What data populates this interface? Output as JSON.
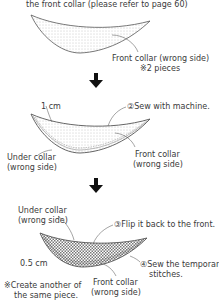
{
  "step1": {
    "caption": "the front collar (please refer to page 60)",
    "label_line1": "Front collar (wrong side)",
    "label_line2": "※2 pieces"
  },
  "step2": {
    "seam_allowance": "1 cm",
    "instruction": "②Sew with machine.",
    "under_collar_line1": "Under collar",
    "under_collar_line2": "(wrong side)",
    "front_collar_line1": "Front collar",
    "front_collar_line2": "(wrong side)"
  },
  "step3": {
    "under_collar_line1": "Under collar",
    "under_collar_line2": "(wrong side)",
    "instruction_flip": "③Flip it back to the front.",
    "seam_allowance": "0.5 cm",
    "instruction_sew_line1": "④Sew the temporary",
    "instruction_sew_line2": "stitches.",
    "note_line1": "※Create another of",
    "note_line2": "the same piece.",
    "front_collar_line1": "Front collar",
    "front_collar_line2": "(wrong side)"
  },
  "colors": {
    "line": "#555555",
    "dots": "#9a9a9a",
    "arrow": "#111111"
  }
}
